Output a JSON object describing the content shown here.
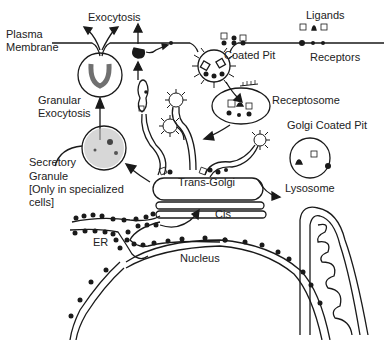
{
  "diagram": {
    "type": "cell-biology-schematic",
    "colors": {
      "stroke": "#1a1a1a",
      "background": "#ffffff",
      "text": "#222222"
    }
  },
  "labels": {
    "exocytosis": "Exocytosis",
    "plasma_membrane_1": "Plasma",
    "plasma_membrane_2": "Membrane",
    "ligands": "Ligands",
    "coated_pit": "Coated Pit",
    "receptors": "Receptors",
    "receptosome": "Receptosome",
    "granular_exocytosis_1": "Granular",
    "granular_exocytosis_2": "Exocytosis",
    "golgi_coated_pit": "Golgi Coated Pit",
    "secretory_granule_1": "Secretory",
    "secretory_granule_2": "Granule",
    "secretory_granule_3": "[Only in specialized",
    "secretory_granule_4": "cells]",
    "trans_golgi": "Trans-Golgi",
    "lysosome": "Lysosome",
    "cis": "Cis",
    "er": "ER",
    "nucleus": "Nucleus"
  },
  "structures": [
    "plasma-membrane",
    "ligands",
    "receptors",
    "coated-pit",
    "receptosome",
    "secretory-granule",
    "granular-exocytosis-vesicle",
    "trans-golgi",
    "cis-golgi",
    "golgi-coated-pits",
    "lysosome",
    "endoplasmic-reticulum",
    "nucleus",
    "mitochondrion"
  ]
}
